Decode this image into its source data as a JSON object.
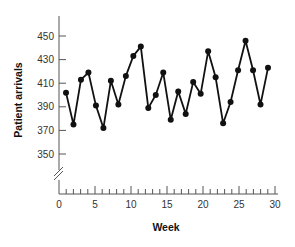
{
  "chart_data": {
    "type": "line",
    "title": "",
    "xlabel": "Week",
    "ylabel": "Patient arrivals",
    "xlim": [
      0,
      30
    ],
    "ylim": [
      330,
      460
    ],
    "y_axis_break": true,
    "grid": false,
    "legend": null,
    "x_ticks": [
      0,
      5,
      10,
      15,
      20,
      25,
      30
    ],
    "y_ticks": [
      350,
      370,
      390,
      410,
      430,
      450
    ],
    "series": [
      {
        "name": "Patient arrivals",
        "color": "#111111",
        "marker": "circle",
        "x": [
          1,
          2,
          3,
          4,
          5,
          6,
          7,
          8,
          9,
          10,
          11,
          12,
          13,
          14,
          15,
          16,
          17,
          18,
          19,
          20,
          21,
          22,
          23,
          24,
          25,
          26,
          27,
          28
        ],
        "values": [
          402,
          375,
          413,
          419,
          391,
          372,
          412,
          392,
          416,
          433,
          441,
          389,
          400,
          419,
          379,
          403,
          384,
          411,
          401,
          437,
          415,
          376,
          394,
          421,
          446,
          421,
          392,
          423
        ]
      }
    ]
  }
}
